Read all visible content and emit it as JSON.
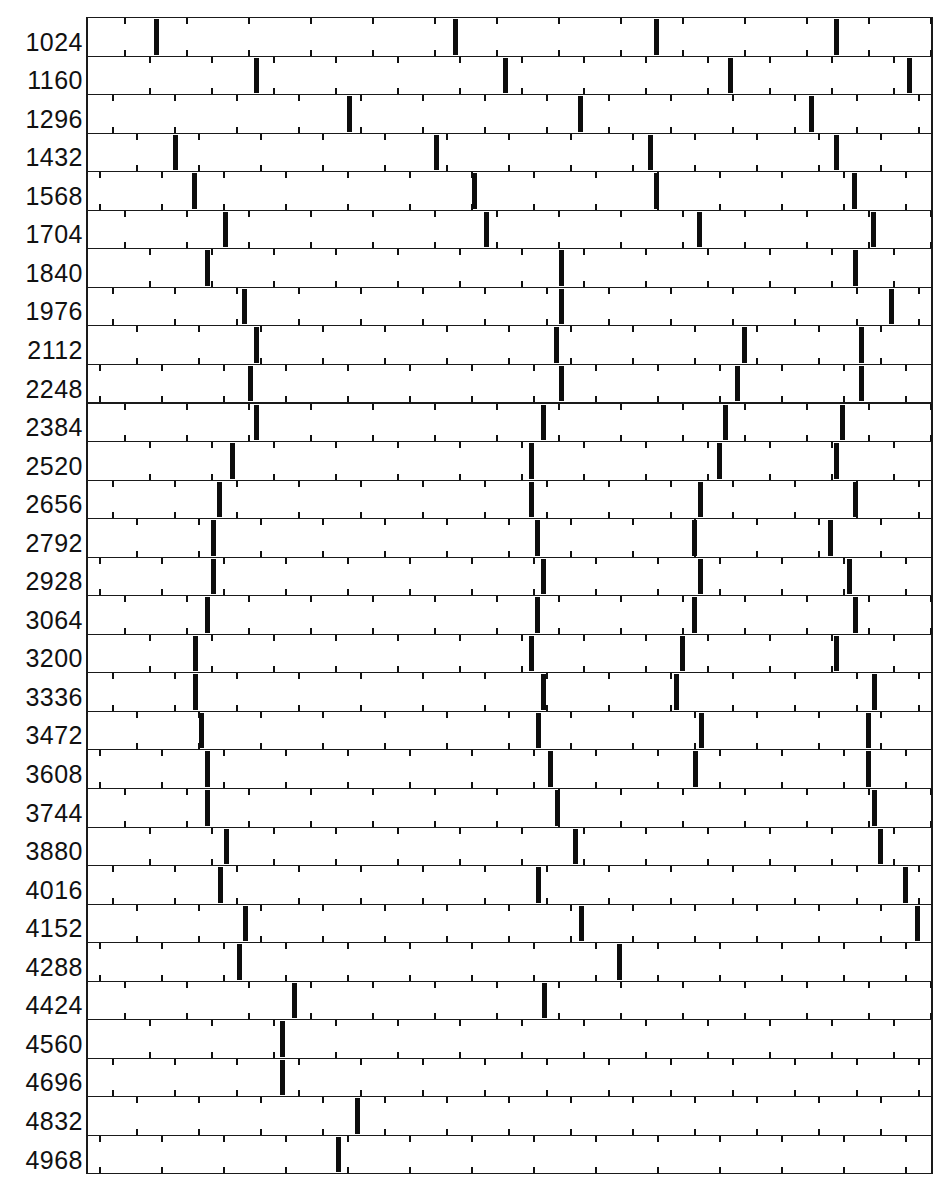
{
  "chart_data": {
    "type": "event-raster",
    "title": "",
    "xlabel": "",
    "ylabel": "",
    "grid": false,
    "legend": null,
    "tick_spacing_px": 62,
    "x_range_px": [
      86,
      933
    ],
    "rows": [
      {
        "label": "1024",
        "events_px": [
          154,
          453,
          654,
          834
        ]
      },
      {
        "label": "1160",
        "events_px": [
          254,
          503,
          728,
          907
        ]
      },
      {
        "label": "1296",
        "events_px": [
          347,
          578,
          809
        ]
      },
      {
        "label": "1432",
        "events_px": [
          173,
          434,
          648,
          834
        ]
      },
      {
        "label": "1568",
        "events_px": [
          192,
          472,
          654,
          852
        ]
      },
      {
        "label": "1704",
        "events_px": [
          223,
          484,
          697,
          871
        ]
      },
      {
        "label": "1840",
        "events_px": [
          205,
          559,
          853
        ]
      },
      {
        "label": "1976",
        "events_px": [
          242,
          559,
          889
        ]
      },
      {
        "label": "2112",
        "events_px": [
          254,
          554,
          742,
          859
        ]
      },
      {
        "label": "2248",
        "events_px": [
          248,
          559,
          735,
          859
        ]
      },
      {
        "label": "2384",
        "events_px": [
          254,
          541,
          723,
          840
        ]
      },
      {
        "label": "2520",
        "events_px": [
          230,
          529,
          717,
          834
        ]
      },
      {
        "label": "2656",
        "events_px": [
          217,
          529,
          698,
          853
        ]
      },
      {
        "label": "2792",
        "events_px": [
          211,
          535,
          692,
          828
        ]
      },
      {
        "label": "2928",
        "events_px": [
          211,
          541,
          698,
          847
        ]
      },
      {
        "label": "3064",
        "events_px": [
          205,
          535,
          692,
          853
        ]
      },
      {
        "label": "3200",
        "events_px": [
          193,
          529,
          680,
          834
        ]
      },
      {
        "label": "3336",
        "events_px": [
          193,
          541,
          674,
          872
        ]
      },
      {
        "label": "3472",
        "events_px": [
          199,
          536,
          699,
          866
        ]
      },
      {
        "label": "3608",
        "events_px": [
          205,
          548,
          693,
          866
        ]
      },
      {
        "label": "3744",
        "events_px": [
          205,
          555,
          872
        ]
      },
      {
        "label": "3880",
        "events_px": [
          224,
          573,
          878
        ]
      },
      {
        "label": "4016",
        "events_px": [
          218,
          536,
          903
        ]
      },
      {
        "label": "4152",
        "events_px": [
          243,
          579,
          915
        ]
      },
      {
        "label": "4288",
        "events_px": [
          237,
          617
        ]
      },
      {
        "label": "4424",
        "events_px": [
          292,
          542
        ]
      },
      {
        "label": "4560",
        "events_px": [
          280
        ]
      },
      {
        "label": "4696",
        "events_px": [
          280
        ]
      },
      {
        "label": "4832",
        "events_px": [
          355
        ]
      },
      {
        "label": "4968",
        "events_px": [
          336
        ]
      }
    ]
  },
  "layout": {
    "top": 17,
    "row_height": 38.55,
    "tick_first_offset": 123,
    "tick_shift_per_row": 24.8
  }
}
